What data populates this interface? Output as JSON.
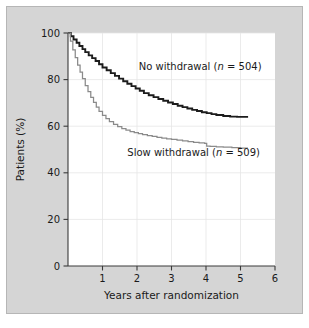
{
  "figure": {
    "background_color": "#d5d5d5",
    "plot_background_color": "#ffffff",
    "border_color": "#b6b6b6"
  },
  "chart_data": {
    "type": "line",
    "subtype": "kaplan-meier-survival",
    "title": "",
    "xlabel": "Years after randomization",
    "ylabel": "Patients (%)",
    "xlim": [
      0,
      6
    ],
    "ylim": [
      0,
      100
    ],
    "xticks": [
      0,
      1,
      2,
      3,
      4,
      5,
      6
    ],
    "xtick_labels": [
      "",
      "1",
      "2",
      "3",
      "4",
      "5",
      "6"
    ],
    "yticks": [
      0,
      20,
      40,
      60,
      80,
      100
    ],
    "ytick_labels": [
      "0",
      "20",
      "40",
      "60",
      "80",
      "100"
    ],
    "grid": "faint-both",
    "legend_position": "inline-annotations",
    "series": [
      {
        "name": "No withdrawal",
        "n": 504,
        "annotation": "No withdrawal (n = 504)",
        "color": "#1c1c1c",
        "line_width": 1.9,
        "annotation_x": 2.05,
        "annotation_y": 84,
        "x": [
          0.0,
          0.08,
          0.16,
          0.25,
          0.33,
          0.42,
          0.5,
          0.6,
          0.7,
          0.8,
          0.9,
          1.0,
          1.12,
          1.24,
          1.36,
          1.48,
          1.6,
          1.72,
          1.84,
          1.96,
          2.08,
          2.2,
          2.34,
          2.48,
          2.62,
          2.76,
          2.9,
          3.04,
          3.18,
          3.32,
          3.46,
          3.6,
          3.74,
          3.88,
          4.02,
          4.16,
          4.3,
          4.5,
          4.7,
          4.9,
          5.1,
          5.22
        ],
        "y": [
          100.0,
          98.6,
          97.2,
          95.8,
          94.4,
          93.1,
          91.8,
          90.4,
          89.2,
          88.0,
          86.6,
          85.2,
          84.0,
          82.8,
          81.6,
          80.4,
          79.3,
          78.2,
          77.2,
          76.2,
          75.2,
          74.2,
          73.3,
          72.5,
          71.7,
          70.9,
          70.2,
          69.5,
          68.8,
          68.2,
          67.6,
          67.0,
          66.5,
          66.0,
          65.6,
          65.2,
          64.8,
          64.4,
          64.1,
          64.0,
          64.0,
          64.0
        ]
      },
      {
        "name": "Slow withdrawal",
        "n": 509,
        "annotation": "Slow withdrawal (n = 509)",
        "color": "#8a8a8a",
        "line_width": 1.25,
        "annotation_x": 1.72,
        "annotation_y": 47,
        "x": [
          0.0,
          0.07,
          0.14,
          0.21,
          0.28,
          0.35,
          0.42,
          0.5,
          0.58,
          0.66,
          0.74,
          0.82,
          0.9,
          1.0,
          1.1,
          1.2,
          1.32,
          1.44,
          1.56,
          1.68,
          1.8,
          1.92,
          2.04,
          2.16,
          2.3,
          2.44,
          2.58,
          2.72,
          2.86,
          3.0,
          3.16,
          3.32,
          3.48,
          3.64,
          3.8,
          3.96,
          4.02,
          4.12,
          4.3,
          4.5,
          4.75,
          5.0,
          5.2
        ],
        "y": [
          100.0,
          96.5,
          92.8,
          89.4,
          86.2,
          83.2,
          80.4,
          77.4,
          74.8,
          72.4,
          70.2,
          68.2,
          66.4,
          64.6,
          63.2,
          62.0,
          60.8,
          59.8,
          59.0,
          58.3,
          57.7,
          57.2,
          56.8,
          56.4,
          56.0,
          55.6,
          55.2,
          54.9,
          54.6,
          54.3,
          54.0,
          53.7,
          53.4,
          53.1,
          52.8,
          52.6,
          51.5,
          51.3,
          51.1,
          51.0,
          50.8,
          50.6,
          50.5
        ]
      }
    ]
  }
}
